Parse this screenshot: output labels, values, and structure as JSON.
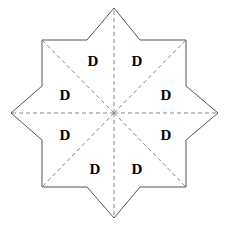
{
  "figure": {
    "background_color": "#ffffff",
    "outline_color": "#555555",
    "dashed_color": "#888888",
    "label_color": "#000000",
    "center": {
      "x": 114,
      "y": 113
    }
  },
  "star": {
    "outline_points": "114,8 140,40 186,40 186,86 218,113 186,140 186,187 140,187 114,218 87,187 42,187 42,140 11,113 42,86 42,40 87,40",
    "outer_points": [
      {
        "name": "point-top",
        "x": 114,
        "y": 8
      },
      {
        "name": "point-right",
        "x": 218,
        "y": 113
      },
      {
        "name": "point-bottom",
        "x": 114,
        "y": 218
      },
      {
        "name": "point-left",
        "x": 11,
        "y": 113
      },
      {
        "name": "point-top-left",
        "x": 42,
        "y": 40
      },
      {
        "name": "point-top-right",
        "x": 186,
        "y": 40
      },
      {
        "name": "point-bottom-right",
        "x": 186,
        "y": 187
      },
      {
        "name": "point-bottom-left",
        "x": 42,
        "y": 187
      }
    ],
    "dashed_spokes": [
      {
        "name": "spoke-top",
        "x2": 114,
        "y2": 8
      },
      {
        "name": "spoke-top-right",
        "x2": 186,
        "y2": 40
      },
      {
        "name": "spoke-right",
        "x2": 218,
        "y2": 113
      },
      {
        "name": "spoke-bottom-right",
        "x2": 186,
        "y2": 187
      },
      {
        "name": "spoke-bottom",
        "x2": 114,
        "y2": 218
      },
      {
        "name": "spoke-bottom-left",
        "x2": 42,
        "y2": 187
      },
      {
        "name": "spoke-left",
        "x2": 11,
        "y2": 113
      },
      {
        "name": "spoke-top-left",
        "x2": 42,
        "y2": 40
      }
    ]
  },
  "sector_labels": [
    {
      "name": "sector-label-north-west",
      "text": "D",
      "x": 93,
      "y": 61
    },
    {
      "name": "sector-label-north-east",
      "text": "D",
      "x": 137,
      "y": 61
    },
    {
      "name": "sector-label-west-north",
      "text": "D",
      "x": 65,
      "y": 95
    },
    {
      "name": "sector-label-east-north",
      "text": "D",
      "x": 166,
      "y": 95
    },
    {
      "name": "sector-label-west-south",
      "text": "D",
      "x": 65,
      "y": 135
    },
    {
      "name": "sector-label-east-south",
      "text": "D",
      "x": 166,
      "y": 135
    },
    {
      "name": "sector-label-south-west",
      "text": "D",
      "x": 95,
      "y": 169
    },
    {
      "name": "sector-label-south-east",
      "text": "D",
      "x": 137,
      "y": 169
    }
  ]
}
